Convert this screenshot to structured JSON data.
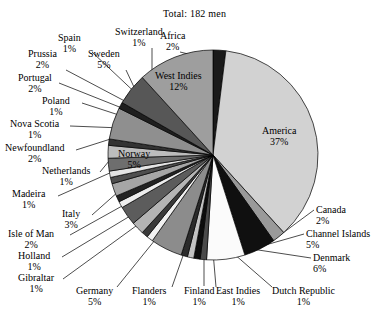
{
  "chart": {
    "title": "Total: 182 men",
    "center": {
      "x": 213,
      "y": 155
    },
    "radius": 105
  },
  "chart_data": {
    "type": "pie",
    "title": "Total: 182 men",
    "xlabel": "",
    "ylabel": "",
    "total_label": "Total: 182 men",
    "total": 182,
    "units": "men",
    "value_suffix": "%",
    "legend": "none",
    "grid": false,
    "start_angle_deg": 0,
    "direction": "clockwise",
    "categories": [
      "Africa",
      "America",
      "Canada",
      "Channel Islands",
      "Denmark",
      "Dutch Republic",
      "East Indies",
      "Finland",
      "Flanders",
      "Germany",
      "Gibraltar",
      "Holland",
      "Isle of Man",
      "Italy",
      "Madeira",
      "Netherlands",
      "Newfoundland",
      "Nova Scotia",
      "Poland",
      "Portugal",
      "Prussia",
      "Spain",
      "Sweden",
      "Switzerland",
      "Norway",
      "West Indies"
    ],
    "values": [
      2,
      37,
      2,
      5,
      6,
      1,
      1,
      1,
      1,
      5,
      1,
      1,
      2,
      3,
      1,
      1,
      2,
      1,
      1,
      2,
      2,
      1,
      5,
      1,
      5,
      12
    ],
    "slices": [
      {
        "label": "Africa",
        "pct": "2%",
        "value": 2,
        "color": "#1a1a1a"
      },
      {
        "label": "America",
        "pct": "37%",
        "value": 37,
        "color": "#d2d2d2"
      },
      {
        "label": "Canada",
        "pct": "2%",
        "value": 2,
        "color": "#9a9a9a"
      },
      {
        "label": "Channel Islands",
        "pct": "5%",
        "value": 5,
        "color": "#101010"
      },
      {
        "label": "Denmark",
        "pct": "6%",
        "value": 6,
        "color": "#fbfbfb"
      },
      {
        "label": "Dutch Republic",
        "pct": "1%",
        "value": 1,
        "color": "#4a4a4a"
      },
      {
        "label": "East Indies",
        "pct": "1%",
        "value": 1,
        "color": "#0d0d0d"
      },
      {
        "label": "Finland",
        "pct": "1%",
        "value": 1,
        "color": "#c2c2c2"
      },
      {
        "label": "Flanders",
        "pct": "1%",
        "value": 1,
        "color": "#2b2b2b"
      },
      {
        "label": "Germany",
        "pct": "5%",
        "value": 5,
        "color": "#8c8c8c"
      },
      {
        "label": "Gibraltar",
        "pct": "1%",
        "value": 1,
        "color": "#f2f2f2"
      },
      {
        "label": "Holland",
        "pct": "1%",
        "value": 1,
        "color": "#3a3a3a"
      },
      {
        "label": "Isle of Man",
        "pct": "2%",
        "value": 2,
        "color": "#b4b4b4"
      },
      {
        "label": "Italy",
        "pct": "3%",
        "value": 3,
        "color": "#5c5c5c"
      },
      {
        "label": "Madeira",
        "pct": "1%",
        "value": 1,
        "color": "#ededed"
      },
      {
        "label": "Netherlands",
        "pct": "1%",
        "value": 1,
        "color": "#232323"
      },
      {
        "label": "Newfoundland",
        "pct": "2%",
        "value": 2,
        "color": "#a6a6a6"
      },
      {
        "label": "Nova Scotia",
        "pct": "1%",
        "value": 1,
        "color": "#4f4f4f"
      },
      {
        "label": "Poland",
        "pct": "1%",
        "value": 1,
        "color": "#e4e4e4"
      },
      {
        "label": "Portugal",
        "pct": "2%",
        "value": 2,
        "color": "#6e6e6e"
      },
      {
        "label": "Prussia",
        "pct": "2%",
        "value": 2,
        "color": "#bdbdbd"
      },
      {
        "label": "Spain",
        "pct": "1%",
        "value": 1,
        "color": "#333333"
      },
      {
        "label": "Sweden",
        "pct": "5%",
        "value": 5,
        "color": "#8f8f8f"
      },
      {
        "label": "Switzerland",
        "pct": "1%",
        "value": 1,
        "color": "#1f1f1f"
      },
      {
        "label": "Norway",
        "pct": "5%",
        "value": 5,
        "color": "#575757"
      },
      {
        "label": "West Indies",
        "pct": "12%",
        "value": 12,
        "color": "#9e9e9e"
      }
    ]
  },
  "inside_labels": [
    {
      "name": "America",
      "pct": "37%",
      "x": 262,
      "y": 125
    },
    {
      "name": "West Indies",
      "pct": "12%",
      "x": 155,
      "y": 70
    },
    {
      "name": "Norway",
      "pct": "5%",
      "x": 118,
      "y": 148
    }
  ],
  "callouts": [
    {
      "name": "Africa",
      "pct": "2%",
      "x": 160,
      "y": 30,
      "align": "ta-c",
      "lx": 180,
      "ly": 52,
      "tx": 213,
      "ty": 60
    },
    {
      "name": "Switzerland",
      "pct": "1%",
      "x": 115,
      "y": 26,
      "align": "ta-c",
      "lx": 152,
      "ly": 48,
      "tx": 152,
      "ty": 92
    },
    {
      "name": "Spain",
      "pct": "1%",
      "x": 58,
      "y": 32,
      "align": "ta-c",
      "lx": 92,
      "ly": 52,
      "tx": 143,
      "ty": 100
    },
    {
      "name": "Sweden",
      "pct": "5%",
      "x": 88,
      "y": 48,
      "align": "ta-c",
      "lx": 126,
      "ly": 70,
      "tx": 141,
      "ty": 102
    },
    {
      "name": "Prussia",
      "pct": "2%",
      "x": 28,
      "y": 48,
      "align": "ta-c",
      "lx": 66,
      "ly": 70,
      "tx": 136,
      "ty": 107
    },
    {
      "name": "Portugal",
      "pct": "2%",
      "x": 18,
      "y": 72,
      "align": "ta-c",
      "lx": 59,
      "ly": 83,
      "tx": 132,
      "ty": 112
    },
    {
      "name": "Poland",
      "pct": "1%",
      "x": 42,
      "y": 95,
      "align": "ta-c",
      "lx": 82,
      "ly": 103,
      "tx": 128,
      "ty": 118
    },
    {
      "name": "Nova Scotia",
      "pct": "1%",
      "x": 10,
      "y": 118,
      "align": "ta-c",
      "lx": 70,
      "ly": 126,
      "tx": 122,
      "ty": 128
    },
    {
      "name": "Newfoundland",
      "pct": "2%",
      "x": 5,
      "y": 142,
      "align": "ta-c",
      "lx": 76,
      "ly": 150,
      "tx": 120,
      "ty": 136
    },
    {
      "name": "Netherlands",
      "pct": "1%",
      "x": 42,
      "y": 165,
      "align": "ta-c",
      "lx": 100,
      "ly": 172,
      "tx": 118,
      "ty": 150
    },
    {
      "name": "Madeira",
      "pct": "1%",
      "x": 12,
      "y": 188,
      "align": "ta-c",
      "lx": 58,
      "ly": 196,
      "tx": 112,
      "ty": 172
    },
    {
      "name": "Italy",
      "pct": "3%",
      "x": 62,
      "y": 208,
      "align": "ta-c",
      "lx": 92,
      "ly": 215,
      "tx": 128,
      "ty": 183
    },
    {
      "name": "Isle of Man",
      "pct": "2%",
      "x": 8,
      "y": 228,
      "align": "ta-c",
      "lx": 70,
      "ly": 235,
      "tx": 140,
      "ty": 196
    },
    {
      "name": "Holland",
      "pct": "1%",
      "x": 18,
      "y": 250,
      "align": "ta-c",
      "lx": 62,
      "ly": 257,
      "tx": 150,
      "ty": 204
    },
    {
      "name": "Gibraltar",
      "pct": "1%",
      "x": 18,
      "y": 272,
      "align": "ta-c",
      "lx": 63,
      "ly": 279,
      "tx": 158,
      "ty": 210
    },
    {
      "name": "Germany",
      "pct": "5%",
      "x": 76,
      "y": 285,
      "align": "ta-c",
      "lx": 117,
      "ly": 287,
      "tx": 172,
      "ty": 219
    },
    {
      "name": "Flanders",
      "pct": "1%",
      "x": 132,
      "y": 285,
      "align": "ta-c",
      "lx": 172,
      "ly": 287,
      "tx": 192,
      "ty": 230
    },
    {
      "name": "Finland",
      "pct": "1%",
      "x": 184,
      "y": 285,
      "align": "ta-c",
      "lx": 204,
      "ly": 286,
      "tx": 204,
      "ty": 243
    },
    {
      "name": "East Indies",
      "pct": "1%",
      "x": 216,
      "y": 285,
      "align": "ta-c",
      "lx": 216,
      "ly": 287,
      "tx": 212,
      "ty": 240
    },
    {
      "name": "Dutch Republic",
      "pct": "1%",
      "x": 272,
      "y": 285,
      "align": "ta-c",
      "lx": 272,
      "ly": 287,
      "tx": 218,
      "ty": 240
    },
    {
      "name": "Denmark",
      "pct": "6%",
      "x": 313,
      "y": 252,
      "align": "ta-l",
      "lx": 311,
      "ly": 258,
      "tx": 232,
      "ty": 246
    },
    {
      "name": "Channel Islands",
      "pct": "5%",
      "x": 306,
      "y": 228,
      "align": "ta-l",
      "lx": 304,
      "ly": 234,
      "tx": 248,
      "ty": 250
    },
    {
      "name": "Canada",
      "pct": "2%",
      "x": 316,
      "y": 204,
      "align": "ta-l",
      "lx": 314,
      "ly": 210,
      "tx": 268,
      "ty": 244
    }
  ]
}
